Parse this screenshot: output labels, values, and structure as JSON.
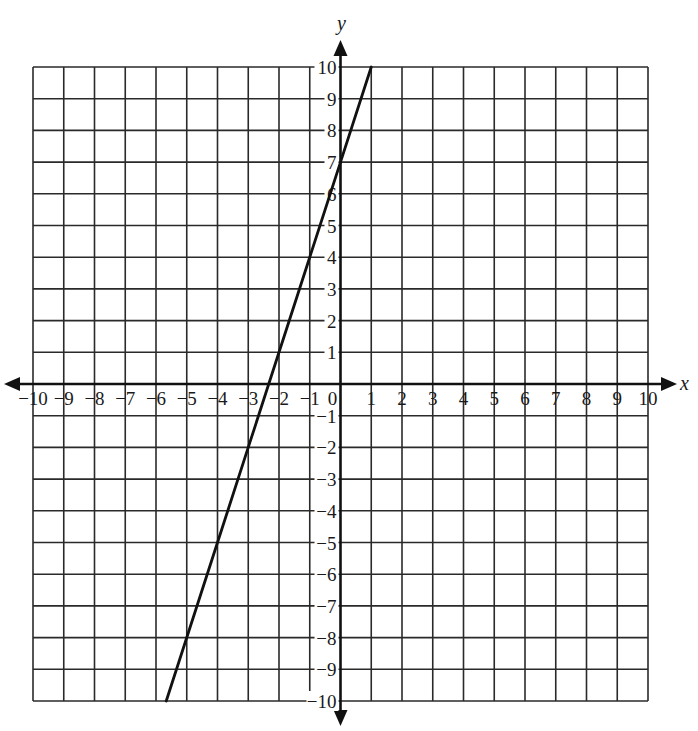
{
  "chart_data": {
    "type": "line",
    "title": "",
    "xlabel": "x",
    "ylabel": "y",
    "xlim": [
      -10,
      10
    ],
    "ylim": [
      -10,
      10
    ],
    "grid": true,
    "grid_step": 1,
    "legend": null,
    "x_tick_labels": [
      "−10",
      "−9",
      "−8",
      "−7",
      "−6",
      "−5",
      "−4",
      "−3",
      "−2",
      "−1",
      "0",
      "1",
      "2",
      "3",
      "4",
      "5",
      "6",
      "7",
      "8",
      "9",
      "10"
    ],
    "y_tick_labels": [
      "−10",
      "−9",
      "−8",
      "−7",
      "−6",
      "−5",
      "−4",
      "−3",
      "−2",
      "−1",
      "1",
      "2",
      "3",
      "4",
      "5",
      "6",
      "7",
      "8",
      "9",
      "10"
    ],
    "origin_label": "0",
    "series": [
      {
        "name": "line",
        "equation": "y = 3x + 7",
        "slope": 3,
        "intercept": 7,
        "x": [
          -5.667,
          -4,
          -3,
          -2,
          -1,
          0,
          1
        ],
        "y": [
          -10,
          -5,
          -2,
          1,
          4,
          7,
          10
        ],
        "color": "#111111"
      }
    ]
  },
  "axes": {
    "x_label": "x",
    "y_label": "y"
  },
  "colors": {
    "grid": "#2a2a2a",
    "axis": "#111111",
    "line": "#111111",
    "background": "#ffffff"
  }
}
